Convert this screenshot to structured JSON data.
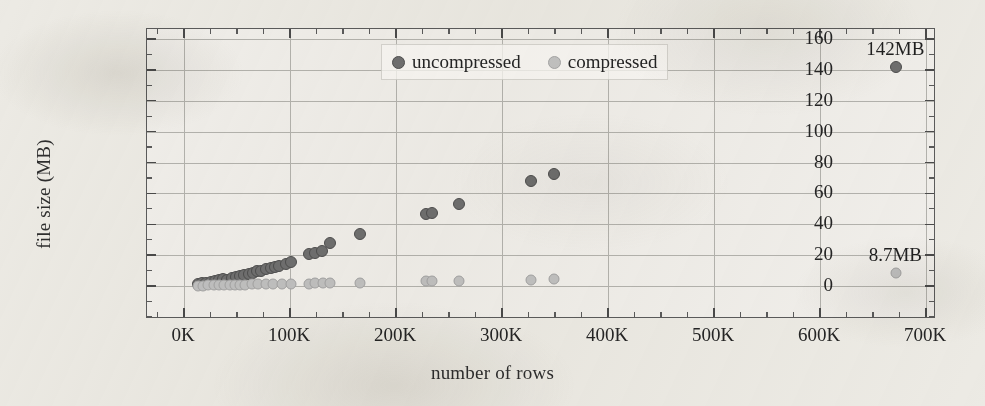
{
  "chart_data": {
    "type": "scatter",
    "title": "",
    "xlabel": "number of rows",
    "ylabel": "file size (MB)",
    "xlim": [
      0,
      700000
    ],
    "ylim": [
      0,
      160
    ],
    "grid": true,
    "x_tick_labels": [
      "0K",
      "100K",
      "200K",
      "300K",
      "400K",
      "500K",
      "600K",
      "700K"
    ],
    "x_tick_values": [
      0,
      100000,
      200000,
      300000,
      400000,
      500000,
      600000,
      700000
    ],
    "x_minor_step": 25000,
    "y_tick_labels": [
      "0",
      "20",
      "40",
      "60",
      "80",
      "100",
      "120",
      "140",
      "160"
    ],
    "y_tick_values": [
      0,
      20,
      40,
      60,
      80,
      100,
      120,
      140,
      160
    ],
    "y_minor_step": 10,
    "legend": {
      "position": "top-center-inside",
      "entries": [
        {
          "name": "uncompressed",
          "color": "#6f6f6f"
        },
        {
          "name": "compressed",
          "color": "#c0c0c0"
        }
      ]
    },
    "series": [
      {
        "name": "uncompressed",
        "color": "#6f6f6f",
        "points": [
          [
            13000,
            1.2
          ],
          [
            17000,
            1.8
          ],
          [
            21000,
            2.2
          ],
          [
            25000,
            2.6
          ],
          [
            29000,
            3.2
          ],
          [
            33000,
            3.8
          ],
          [
            37000,
            4.4
          ],
          [
            41000,
            4.2
          ],
          [
            45000,
            5.4
          ],
          [
            49000,
            6.0
          ],
          [
            53000,
            6.6
          ],
          [
            57000,
            7.2
          ],
          [
            61000,
            8.0
          ],
          [
            65000,
            8.6
          ],
          [
            69000,
            9.4
          ],
          [
            73000,
            10.0
          ],
          [
            77000,
            10.8
          ],
          [
            82000,
            11.6
          ],
          [
            86000,
            12.2
          ],
          [
            90000,
            13.0
          ],
          [
            96000,
            14.0
          ],
          [
            101000,
            15.6
          ],
          [
            118000,
            20.5
          ],
          [
            124000,
            21.5
          ],
          [
            130000,
            22.5
          ],
          [
            138000,
            28.0
          ],
          [
            166000,
            34.0
          ],
          [
            228000,
            46.5
          ],
          [
            234000,
            47.0
          ],
          [
            259000,
            53.0
          ],
          [
            327000,
            68.0
          ],
          [
            349000,
            72.5
          ],
          [
            672000,
            142.0
          ]
        ]
      },
      {
        "name": "compressed",
        "color": "#c0c0c0",
        "points": [
          [
            13000,
            0.2
          ],
          [
            18000,
            0.3
          ],
          [
            23000,
            0.4
          ],
          [
            28000,
            0.5
          ],
          [
            33000,
            0.6
          ],
          [
            38000,
            0.6
          ],
          [
            43000,
            0.7
          ],
          [
            48000,
            0.8
          ],
          [
            53000,
            0.8
          ],
          [
            58000,
            0.9
          ],
          [
            64000,
            1.0
          ],
          [
            70000,
            1.0
          ],
          [
            77000,
            1.1
          ],
          [
            84000,
            1.2
          ],
          [
            92000,
            1.3
          ],
          [
            101000,
            1.4
          ],
          [
            118000,
            1.6
          ],
          [
            124000,
            1.7
          ],
          [
            131000,
            1.8
          ],
          [
            138000,
            1.9
          ],
          [
            166000,
            2.2
          ],
          [
            228000,
            3.0
          ],
          [
            234000,
            3.1
          ],
          [
            259000,
            3.3
          ],
          [
            327000,
            4.2
          ],
          [
            349000,
            4.4
          ],
          [
            672000,
            8.7
          ]
        ]
      }
    ],
    "annotations": [
      {
        "text": "142MB",
        "x": 672000,
        "y": 142.0,
        "series": "uncompressed"
      },
      {
        "text": "8.7MB",
        "x": 672000,
        "y": 8.7,
        "series": "compressed"
      }
    ]
  }
}
